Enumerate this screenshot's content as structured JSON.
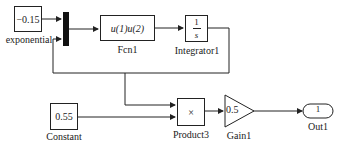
{
  "blocks": {
    "exponential": {
      "value": "−0.15",
      "label": "exponential"
    },
    "mux": {
      "label": ""
    },
    "fcn1": {
      "expr": "u(1)u(2)",
      "label": "Fcn1"
    },
    "integrator1": {
      "num": "1",
      "den": "s",
      "label": "Integrator1"
    },
    "constant": {
      "value": "0.55",
      "label": "Constant"
    },
    "product3": {
      "symbol": "×",
      "label": "Product3"
    },
    "gain1": {
      "value": "0.5",
      "label": "Gain1"
    },
    "out1": {
      "port": "1",
      "label": "Out1"
    }
  }
}
